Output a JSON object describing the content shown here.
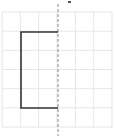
{
  "diagram": {
    "type": "grid-reflection",
    "grid": {
      "left": 2,
      "top": 12,
      "right": 112,
      "bottom": 127,
      "cols": 6,
      "rows": 6,
      "line_color": "#e6e6e6"
    },
    "mirror_line": {
      "x": 58,
      "y1": 4,
      "y2": 136,
      "style": "dashed",
      "color": "#888888"
    },
    "shape": {
      "points": [
        [
          58,
          32
        ],
        [
          21,
          32
        ],
        [
          21,
          108
        ],
        [
          58,
          108
        ]
      ],
      "stroke": "#333333",
      "stroke_width": 1.6
    },
    "label_mark": {
      "x": 68,
      "y": 1,
      "color": "#555555"
    }
  }
}
